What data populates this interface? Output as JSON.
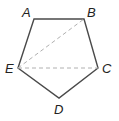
{
  "figure": {
    "colors": {
      "edge": "#4a4a4a",
      "diagonal": "#b0b0b0",
      "label": "#222222"
    },
    "vertices": [
      {
        "name": "A",
        "x": 34,
        "y": 19
      },
      {
        "name": "B",
        "x": 84,
        "y": 19
      },
      {
        "name": "C",
        "x": 98,
        "y": 68
      },
      {
        "name": "D",
        "x": 59,
        "y": 98
      },
      {
        "name": "E",
        "x": 18,
        "y": 68
      }
    ],
    "edges": [
      "AB",
      "BC",
      "CD",
      "DE",
      "EA"
    ],
    "diagonals": [
      "EB",
      "EC"
    ],
    "labels": {
      "A": "A",
      "B": "B",
      "C": "C",
      "D": "D",
      "E": "E"
    }
  }
}
